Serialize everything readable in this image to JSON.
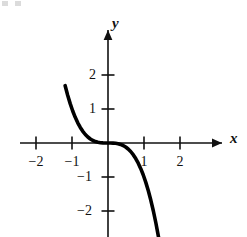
{
  "figure": {
    "background_color": "#ffffff",
    "ink_color": "#000000",
    "width": 247,
    "height": 237
  },
  "axes": {
    "x_label": "x",
    "y_label": "y",
    "origin_px": {
      "x": 108,
      "y": 143
    },
    "unit_px": {
      "x": 36,
      "y": 34
    },
    "x_arrow": "right",
    "y_arrow": "up",
    "x_ticks": [
      {
        "value": -2,
        "label": "−2",
        "px": 36
      },
      {
        "value": -1,
        "label": "−1",
        "px": 72
      },
      {
        "value": 1,
        "label": "1",
        "px": 144
      },
      {
        "value": 2,
        "label": "2",
        "px": 180
      }
    ],
    "y_ticks": [
      {
        "value": 2,
        "label": "2",
        "px": 75
      },
      {
        "value": 1,
        "label": "1",
        "px": 109
      },
      {
        "value": -1,
        "label": "−1",
        "px": 177
      },
      {
        "value": -2,
        "label": "−2",
        "px": 211
      }
    ]
  },
  "chart_data": {
    "type": "line",
    "title": "",
    "xlabel": "x",
    "ylabel": "y",
    "xlim": [
      -2.9,
      3.6
    ],
    "ylim": [
      -3.4,
      3.3
    ],
    "grid": false,
    "legend": null,
    "series": [
      {
        "name": "y = -x^3",
        "expression": "y = -x³",
        "stroke_color": "#000000",
        "stroke_width": 3.6,
        "x": [
          -1.19,
          -1.12,
          -1.05,
          -0.98,
          -0.91,
          -0.84,
          -0.77,
          -0.7,
          -0.63,
          -0.56,
          -0.49,
          -0.42,
          -0.35,
          -0.28,
          -0.21,
          -0.14,
          -0.07,
          0.0,
          0.07,
          0.14,
          0.21,
          0.28,
          0.35,
          0.42,
          0.49,
          0.56,
          0.63,
          0.7,
          0.77,
          0.84,
          0.91,
          0.98,
          1.05,
          1.12,
          1.19,
          1.26,
          1.33,
          1.4,
          1.47,
          1.54
        ],
        "y": [
          1.685,
          1.405,
          1.158,
          0.941,
          0.754,
          0.593,
          0.457,
          0.343,
          0.25,
          0.176,
          0.118,
          0.074,
          0.043,
          0.022,
          0.009,
          0.003,
          0.0,
          0.0,
          0.0,
          -0.003,
          -0.009,
          -0.022,
          -0.043,
          -0.074,
          -0.118,
          -0.176,
          -0.25,
          -0.343,
          -0.457,
          -0.593,
          -0.754,
          -0.941,
          -1.158,
          -1.405,
          -1.685,
          -2.0,
          -2.353,
          -2.744,
          -3.177,
          -3.652
        ]
      }
    ],
    "features": {
      "inflection_point": [
        0,
        0
      ],
      "monotonic": "decreasing",
      "passes_through": [
        [
          -1,
          1
        ],
        [
          0,
          0
        ],
        [
          1,
          -1
        ]
      ]
    }
  }
}
